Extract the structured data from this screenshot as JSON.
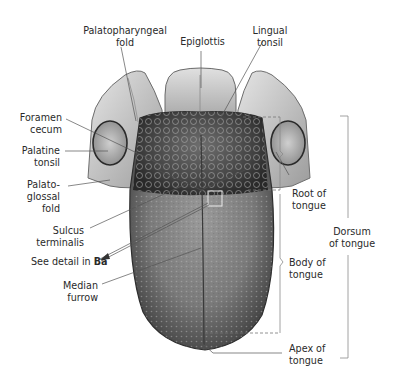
{
  "figure": {
    "colors": {
      "background": "#ffffff",
      "label_text": "#2a2a2a",
      "leader_line": "#555555",
      "bracket_line": "#8a8a8a",
      "tongue_dark": "#3f3f3f",
      "tongue_mid": "#7a7a7a",
      "tongue_light": "#b5b5b5",
      "fold_light": "#d9d9d9"
    }
  },
  "labels": {
    "palatopharyngeal_fold": {
      "line1": "Palatopharyngeal",
      "line2": "fold"
    },
    "epiglottis": {
      "line1": "Epiglottis"
    },
    "lingual_tonsil": {
      "line1": "Lingual",
      "line2": "tonsil"
    },
    "foramen_cecum": {
      "line1": "Foramen",
      "line2": "cecum"
    },
    "palatine_tonsil": {
      "line1": "Palatine",
      "line2": "tonsil"
    },
    "palatoglossal_fold": {
      "line1": "Palato-",
      "line2": "glossal",
      "line3": "fold"
    },
    "sulcus_terminalis": {
      "line1": "Sulcus",
      "line2": "terminalis"
    },
    "see_detail": {
      "prefix": "See detail in ",
      "ref": "Ba"
    },
    "median_furrow": {
      "line1": "Median",
      "line2": "furrow"
    },
    "root_of_tongue": {
      "line1": "Root of",
      "line2": "tongue"
    },
    "body_of_tongue": {
      "line1": "Body of",
      "line2": "tongue"
    },
    "apex_of_tongue": {
      "line1": "Apex of",
      "line2": "tongue"
    },
    "dorsum_of_tongue": {
      "line1": "Dorsum",
      "line2": "of tongue"
    }
  }
}
